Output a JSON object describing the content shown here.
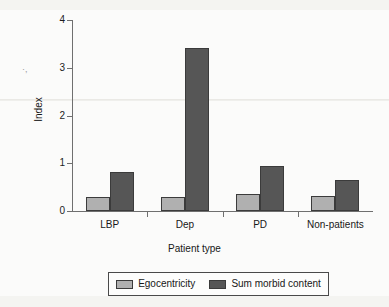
{
  "chart_data": {
    "type": "bar",
    "title": "",
    "xlabel": "Patient type",
    "ylabel": "Index",
    "categories": [
      "LBP",
      "Dep",
      "PD",
      "Non-patients"
    ],
    "series": [
      {
        "name": "Egocentricity",
        "color": "#b0b0b0",
        "values": [
          0.29,
          0.29,
          0.36,
          0.31
        ]
      },
      {
        "name": "Sum morbid content",
        "color": "#565656",
        "values": [
          0.82,
          3.41,
          0.94,
          0.65
        ]
      }
    ],
    "ylim": [
      0,
      4
    ],
    "yticks": [
      "0",
      "1",
      "2",
      "3",
      "4"
    ],
    "ytick_values": [
      0,
      1,
      2,
      3,
      4
    ],
    "grid": false,
    "legend_position": "bottom"
  },
  "artifacts": {
    "stray_mark": "·,"
  }
}
